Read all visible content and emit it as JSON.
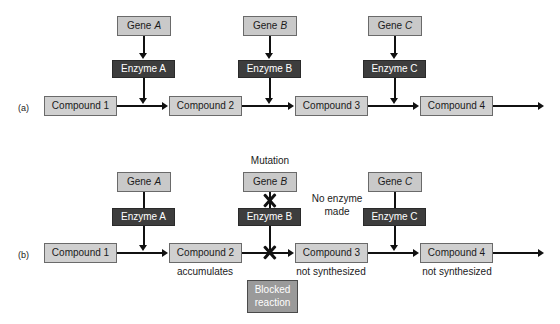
{
  "figure": {
    "panels": [
      {
        "id": "a",
        "label": "(a)",
        "genes": [
          {
            "name": "Gene",
            "letter": "A"
          },
          {
            "name": "Gene",
            "letter": "B"
          },
          {
            "name": "Gene",
            "letter": "C"
          }
        ],
        "enzymes": [
          "Enzyme A",
          "Enzyme B",
          "Enzyme C"
        ],
        "compounds": [
          "Compound 1",
          "Compound 2",
          "Compound 3",
          "Compound 4"
        ],
        "compound_notes": [
          "",
          "",
          "",
          ""
        ],
        "annotations": []
      },
      {
        "id": "b",
        "label": "(b)",
        "genes": [
          {
            "name": "Gene",
            "letter": "A"
          },
          {
            "name": "Gene",
            "letter": "B"
          },
          {
            "name": "Gene",
            "letter": "C"
          }
        ],
        "enzymes": [
          "Enzyme A",
          "Enzyme B",
          "Enzyme C"
        ],
        "compounds": [
          "Compound 1",
          "Compound 2",
          "Compound 3",
          "Compound 4"
        ],
        "compound_notes": [
          "",
          "accumulates",
          "not synthesized",
          "not synthesized"
        ],
        "annotations": {
          "mutation": "Mutation",
          "no_enzyme_line1": "No enzyme",
          "no_enzyme_line2": "made",
          "blocked_line1": "Blocked",
          "blocked_line2": "reaction"
        }
      }
    ],
    "colors": {
      "gene_box_fill": "#c9c9c9",
      "enzyme_box_fill": "#3d3d3d",
      "compound_box_fill": "#d0d0d0",
      "blocked_box_fill": "#9a9a9a",
      "stroke": "#111111",
      "background": "#ffffff"
    }
  }
}
